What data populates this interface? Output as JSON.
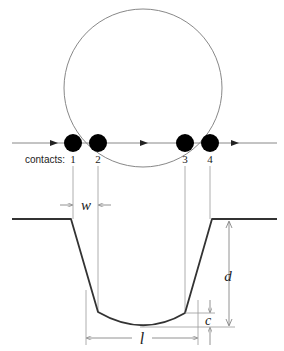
{
  "diagram": {
    "contacts_label": "contacts:",
    "contacts": [
      {
        "label": "1",
        "x": 73
      },
      {
        "label": "2",
        "x": 98
      },
      {
        "label": "3",
        "x": 185
      },
      {
        "label": "4",
        "x": 210
      }
    ],
    "dimensions": {
      "w": "w",
      "d": "d",
      "c": "c",
      "l": "l"
    },
    "colors": {
      "stroke": "#333333",
      "guide": "#999999",
      "ball": "#000000",
      "circle": "#888888"
    }
  }
}
